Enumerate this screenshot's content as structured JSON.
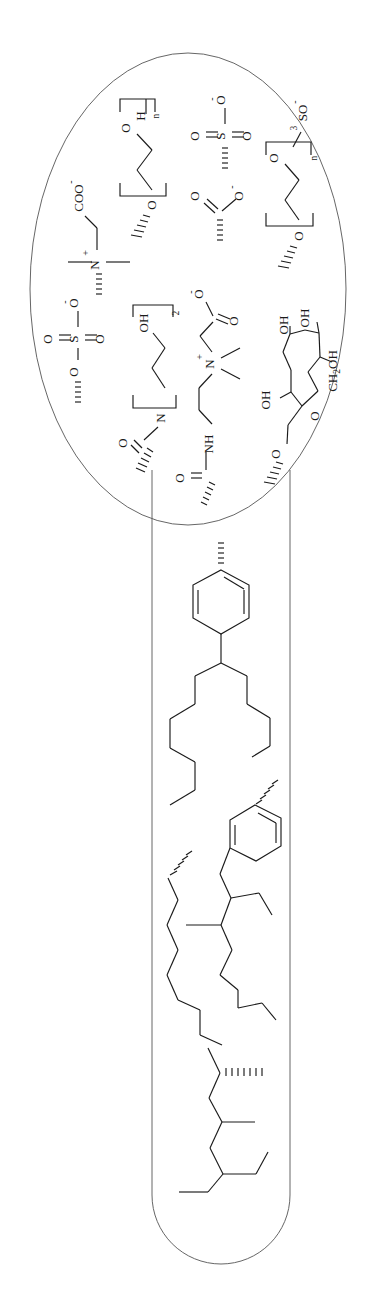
{
  "figure": {
    "background": "#ffffff",
    "ink": "#1a1a1a",
    "outline_color": "#555555",
    "rotation_note": "All atom labels rendered rotated 90 degrees",
    "regions": [
      {
        "name": "hydrophilic-head-region",
        "shape": "ellipse",
        "label": "head groups"
      },
      {
        "name": "hydrophobic-tail-region",
        "shape": "capsule",
        "label": "tail groups"
      }
    ]
  },
  "head_groups": [
    {
      "id": "peg-hydroxyl",
      "name": "polyethylene-glycol-hydroxyl",
      "labels": [
        "H",
        "n",
        "O",
        "O"
      ],
      "terminal": "H",
      "repeat": "n"
    },
    {
      "id": "sulfonate",
      "name": "sulfonate",
      "labels": [
        "O",
        "O",
        "S",
        "O"
      ],
      "charge": "-"
    },
    {
      "id": "ether-sulfate",
      "name": "peg-ether-sulfate",
      "labels": [
        "SO",
        "3",
        "O",
        "O",
        "n"
      ],
      "charge": "-",
      "repeat": "n"
    },
    {
      "id": "carboxybetaine",
      "name": "carboxy-betaine",
      "labels": [
        "COO",
        "N",
        "+"
      ],
      "charge_anion": "-",
      "charge_cation": "+"
    },
    {
      "id": "carboxylate",
      "name": "carboxylate",
      "labels": [
        "O",
        "O"
      ],
      "charge": "-"
    },
    {
      "id": "sulfate-ester",
      "name": "sulfate-ester",
      "labels": [
        "O",
        "O",
        "S",
        "O",
        "O"
      ],
      "charge": "-"
    },
    {
      "id": "bis-hydroxyethyl-amide",
      "name": "bis-hydroxyethyl-amide",
      "labels": [
        "OH",
        "2",
        "N",
        "O"
      ],
      "bracket_subscript": "2"
    },
    {
      "id": "amidopropyl-betaine",
      "name": "amidopropyl-betaine",
      "labels": [
        "O",
        "O",
        "N",
        "+",
        "NH",
        "O"
      ],
      "charge_cation": "+"
    },
    {
      "id": "alkyl-polyglucoside",
      "name": "alkyl-polyglucoside",
      "labels": [
        "OH",
        "OH",
        "OH",
        "CH",
        "2",
        "OH",
        "O",
        "O"
      ],
      "sugar_substituent": "CH2OH"
    }
  ],
  "tail_groups": [
    {
      "id": "tail-1",
      "name": "linear-alkylbenzene-branched",
      "features": [
        "benzene-ring",
        "branched-alkyl-chain"
      ]
    },
    {
      "id": "tail-2",
      "name": "benzyl-branched-alkyl",
      "features": [
        "benzene-ring",
        "ethyl-branch",
        "methyl-branch",
        "long-chain"
      ]
    },
    {
      "id": "tail-3",
      "name": "multi-branched-alkyl",
      "features": [
        "methyl-branch",
        "ethyl-branch"
      ]
    }
  ],
  "atom_labels": {
    "H": "H",
    "n": "n",
    "two": "2",
    "three": "3",
    "O": "O",
    "S": "S",
    "N": "N",
    "NH": "NH",
    "OH": "OH",
    "COO": "COO",
    "SO": "SO",
    "CH": "CH",
    "CH2OH": "CH2OH",
    "plus": "+",
    "minus": "-"
  }
}
